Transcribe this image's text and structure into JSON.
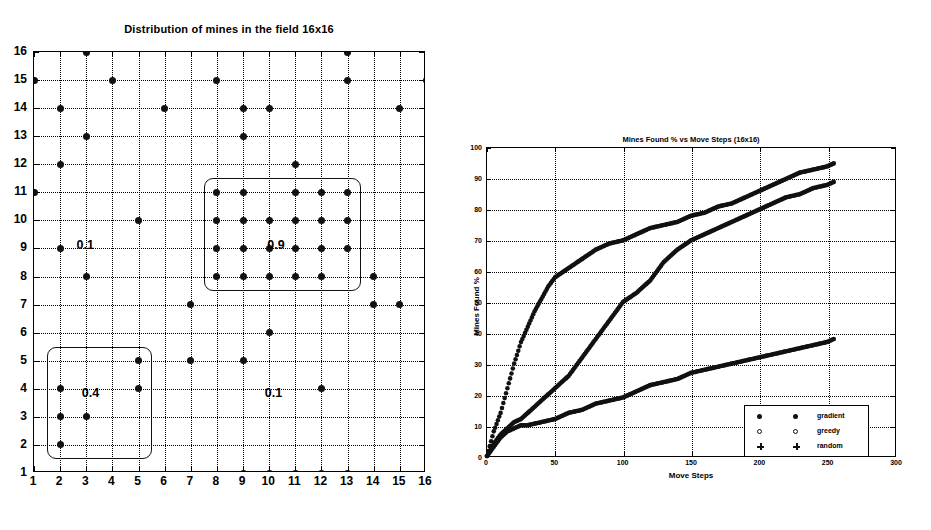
{
  "figure": {
    "panels": [
      "mine-distribution-scatter",
      "mines-found-line-chart"
    ]
  },
  "left": {
    "title": "Distribution of mines in the field 16x16",
    "xticks": [
      "1",
      "2",
      "3",
      "4",
      "5",
      "6",
      "7",
      "8",
      "9",
      "10",
      "11",
      "12",
      "13",
      "14",
      "15",
      "16"
    ],
    "yticks": [
      "1",
      "2",
      "3",
      "4",
      "5",
      "6",
      "7",
      "8",
      "9",
      "10",
      "11",
      "12",
      "13",
      "14",
      "15",
      "16"
    ],
    "region_labels": [
      {
        "text": "0.1",
        "x": 3.0,
        "y": 9.1
      },
      {
        "text": "0.9",
        "x": 10.3,
        "y": 9.1
      },
      {
        "text": "0.4",
        "x": 3.2,
        "y": 3.8
      },
      {
        "text": "0.1",
        "x": 10.2,
        "y": 3.8
      }
    ]
  },
  "right": {
    "title": "Mines Found % vs Move Steps (16x16)",
    "xlabel": "Move Steps",
    "ylabel": "Mines Found %",
    "xticks": [
      "0",
      "50",
      "100",
      "150",
      "200",
      "250",
      "300"
    ],
    "yticks": [
      "0",
      "10",
      "20",
      "30",
      "40",
      "50",
      "60",
      "70",
      "80",
      "90",
      "100"
    ],
    "legend": [
      {
        "label": "gradient",
        "marker": "dot"
      },
      {
        "label": "greedy",
        "marker": "circle"
      },
      {
        "label": "random",
        "marker": "plus"
      }
    ]
  },
  "chart_data": [
    {
      "type": "scatter",
      "title": "Distribution of mines in the field 16x16",
      "xlabel": "",
      "ylabel": "",
      "xlim": [
        1,
        16
      ],
      "ylim": [
        1,
        16
      ],
      "grid": true,
      "marker": "filled-circle",
      "points": [
        [
          3,
          16
        ],
        [
          13,
          16
        ],
        [
          1,
          15
        ],
        [
          4,
          15
        ],
        [
          8,
          15
        ],
        [
          13,
          15
        ],
        [
          16,
          15
        ],
        [
          2,
          14
        ],
        [
          6,
          14
        ],
        [
          9,
          14
        ],
        [
          10,
          14
        ],
        [
          15,
          14
        ],
        [
          3,
          13
        ],
        [
          9,
          13
        ],
        [
          2,
          12
        ],
        [
          11,
          12
        ],
        [
          1,
          11
        ],
        [
          8,
          11
        ],
        [
          9,
          11
        ],
        [
          11,
          11
        ],
        [
          12,
          11
        ],
        [
          13,
          11
        ],
        [
          5,
          10
        ],
        [
          8,
          10
        ],
        [
          9,
          10
        ],
        [
          10,
          10
        ],
        [
          11,
          10
        ],
        [
          12,
          10
        ],
        [
          13,
          10
        ],
        [
          2,
          9
        ],
        [
          8,
          9
        ],
        [
          9,
          9
        ],
        [
          10,
          9
        ],
        [
          11,
          9
        ],
        [
          12,
          9
        ],
        [
          13,
          9
        ],
        [
          3,
          8
        ],
        [
          8,
          8
        ],
        [
          9,
          8
        ],
        [
          10,
          8
        ],
        [
          11,
          8
        ],
        [
          12,
          8
        ],
        [
          14,
          8
        ],
        [
          7,
          7
        ],
        [
          14,
          7
        ],
        [
          15,
          7
        ],
        [
          10,
          6
        ],
        [
          5,
          5
        ],
        [
          7,
          5
        ],
        [
          9,
          5
        ],
        [
          2,
          4
        ],
        [
          5,
          4
        ],
        [
          12,
          4
        ],
        [
          2,
          3
        ],
        [
          3,
          3
        ],
        [
          2,
          2
        ],
        [
          9,
          1
        ],
        [
          10,
          1
        ],
        [
          11,
          1
        ],
        [
          12,
          1
        ],
        [
          13,
          1
        ]
      ],
      "regions": [
        {
          "label": "0.9",
          "x0": 7.5,
          "x1": 13.5,
          "y0": 7.5,
          "y1": 11.5
        },
        {
          "label": "0.4",
          "x0": 1.5,
          "x1": 5.5,
          "y0": 1.5,
          "y1": 5.5
        },
        {
          "label": "0.1",
          "density_note": "background density label at (3,9) and (10,4)"
        }
      ],
      "annotations": [
        "0.1",
        "0.9",
        "0.4",
        "0.1"
      ]
    },
    {
      "type": "line",
      "title": "Mines Found % vs Move Steps (16x16)",
      "xlabel": "Move Steps",
      "ylabel": "Mines Found %",
      "xlim": [
        0,
        300
      ],
      "ylim": [
        0,
        100
      ],
      "xticks": [
        0,
        50,
        100,
        150,
        200,
        250,
        300
      ],
      "yticks": [
        0,
        10,
        20,
        30,
        40,
        50,
        60,
        70,
        80,
        90,
        100
      ],
      "grid": true,
      "legend_position": "lower right",
      "series": [
        {
          "name": "gradient",
          "marker": "dot",
          "x": [
            0,
            5,
            10,
            15,
            20,
            25,
            30,
            35,
            40,
            45,
            50,
            60,
            70,
            80,
            90,
            100,
            110,
            120,
            130,
            140,
            150,
            160,
            170,
            180,
            190,
            200,
            210,
            220,
            230,
            240,
            250,
            255
          ],
          "y": [
            0,
            8,
            14,
            22,
            30,
            37,
            42,
            47,
            51,
            55,
            58,
            61,
            64,
            67,
            69,
            70,
            72,
            74,
            75,
            76,
            78,
            79,
            81,
            82,
            84,
            86,
            88,
            90,
            92,
            93,
            94,
            95
          ]
        },
        {
          "name": "greedy",
          "marker": "circle",
          "x": [
            0,
            5,
            10,
            15,
            20,
            25,
            30,
            40,
            50,
            60,
            70,
            80,
            90,
            100,
            110,
            120,
            130,
            140,
            150,
            160,
            170,
            180,
            190,
            200,
            210,
            220,
            230,
            240,
            250,
            255
          ],
          "y": [
            0,
            4,
            7,
            9,
            11,
            12,
            14,
            18,
            22,
            26,
            32,
            38,
            44,
            50,
            53,
            57,
            63,
            67,
            70,
            72,
            74,
            76,
            78,
            80,
            82,
            84,
            85,
            87,
            88,
            89
          ]
        },
        {
          "name": "random",
          "marker": "plus",
          "x": [
            0,
            5,
            10,
            15,
            20,
            25,
            30,
            40,
            50,
            60,
            70,
            80,
            90,
            100,
            110,
            120,
            130,
            140,
            150,
            160,
            170,
            180,
            190,
            200,
            210,
            220,
            230,
            240,
            250,
            255
          ],
          "y": [
            0,
            3,
            6,
            8,
            9,
            10,
            10,
            11,
            12,
            14,
            15,
            17,
            18,
            19,
            21,
            23,
            24,
            25,
            27,
            28,
            29,
            30,
            31,
            32,
            33,
            34,
            35,
            36,
            37,
            38
          ]
        }
      ]
    }
  ]
}
